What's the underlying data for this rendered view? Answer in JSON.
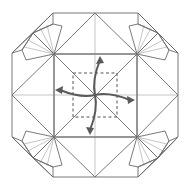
{
  "diagram": {
    "type": "origami-fold-step",
    "colors": {
      "background": "#ffffff",
      "paper_back": "#c9c9c9",
      "center_square": "#d8d8d8",
      "paper_front": "#ffffff",
      "edge_line": "#6a6a6a",
      "arrow": "#5a5a5a"
    },
    "elements": {
      "outer_shape": "octagon",
      "center_square": "gray square with diagonals",
      "flaps": [
        "top-diamond",
        "right-diamond",
        "bottom-diamond",
        "left-diamond"
      ],
      "corner_fans": [
        "top-left",
        "top-right",
        "bottom-left",
        "bottom-right"
      ],
      "fold_guide": "dashed square",
      "arrows": [
        "up",
        "right",
        "down",
        "left"
      ]
    }
  }
}
